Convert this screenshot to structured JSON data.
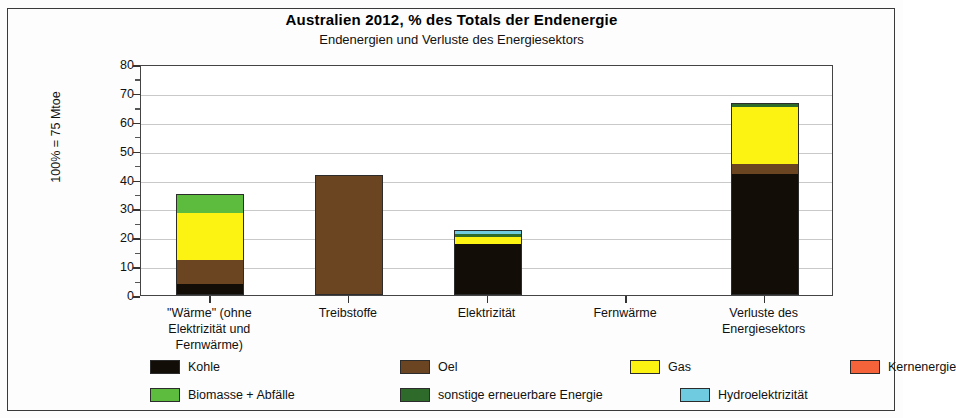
{
  "chart_data": {
    "type": "bar",
    "title": "Australien  2012, % des Totals der Endenergie",
    "subtitle": "Endenergien und Verluste des Energiesektors",
    "ylabel": "100% = 75 Mtoe",
    "xlabel": "",
    "ylim": [
      0,
      80
    ],
    "yticks": [
      0,
      10,
      20,
      30,
      40,
      50,
      60,
      70,
      80
    ],
    "ytick_labels": [
      "0",
      "10",
      "20",
      "30",
      "40",
      "50",
      "60",
      "70",
      "80"
    ],
    "minor_tick_step": 5,
    "grid": true,
    "stacked": true,
    "legend_position": "bottom",
    "categories": [
      "\"Wärme\" (ohne Elektrizität und Fernwärme)",
      "Treibstoffe",
      "Elektrizität",
      "Fernwärme",
      "Verluste des Energiesektors"
    ],
    "category_lines": [
      [
        "\"Wärme\" (ohne",
        "Elektrizität und",
        "Fernwärme)"
      ],
      [
        "Treibstoffe"
      ],
      [
        "Elektrizität"
      ],
      [
        "Fernwärme"
      ],
      [
        "Verluste des",
        "Energiesektors"
      ]
    ],
    "series": [
      {
        "name": "Kohle",
        "color": "#120d07",
        "values": [
          3.8,
          0,
          17.5,
          0,
          42.0
        ]
      },
      {
        "name": "Oel",
        "color": "#6b4522",
        "values": [
          8.4,
          41.5,
          0,
          0,
          3.5
        ]
      },
      {
        "name": "Gas",
        "color": "#fdf313",
        "values": [
          16.1,
          0,
          2.6,
          0,
          19.7
        ]
      },
      {
        "name": "Kernenergie",
        "color": "#f4633a",
        "values": [
          0,
          0,
          0,
          0,
          0
        ]
      },
      {
        "name": "Biomasse + Abfälle",
        "color": "#5dbb3e",
        "values": [
          6.3,
          0,
          0,
          0,
          0
        ]
      },
      {
        "name": "sonstige erneuerbare Energie",
        "color": "#2e6b2b",
        "values": [
          0.2,
          0,
          1.1,
          0,
          1.3
        ]
      },
      {
        "name": "Hydroelektrizität",
        "color": "#6ecbe0",
        "values": [
          0,
          0,
          1.2,
          0,
          0
        ]
      }
    ],
    "totals": [
      34.8,
      41.5,
      22.4,
      0,
      66.5
    ]
  },
  "legend": {
    "row1": [
      "Kohle",
      "Oel",
      "Gas",
      "Kernenergie"
    ],
    "row2": [
      "Biomasse + Abfälle",
      "sonstige erneuerbare Energie",
      "Hydroelektrizität"
    ]
  }
}
